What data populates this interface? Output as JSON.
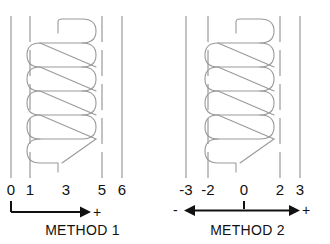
{
  "figure": {
    "title": "",
    "background_color": "#ffffff",
    "line_color": "#9a9a9a",
    "text_color": "#111111",
    "width": 330,
    "height": 244
  },
  "panels": [
    {
      "id": "method-1",
      "caption": "METHOD 1",
      "slot_lines": [
        {
          "name": "slot-line-left-solid",
          "x": 11,
          "style": "solid"
        },
        {
          "name": "slot-line-dashed-1",
          "x": 30,
          "style": "dashed"
        },
        {
          "name": "slot-line-dashed-2",
          "x": 102,
          "style": "dashed"
        },
        {
          "name": "slot-line-right-solid",
          "x": 122,
          "style": "solid"
        }
      ],
      "scale_labels": [
        {
          "text": "0",
          "x": 11
        },
        {
          "text": "1",
          "x": 30
        },
        {
          "text": "3",
          "x": 66
        },
        {
          "text": "5",
          "x": 102
        },
        {
          "text": "6",
          "x": 122
        }
      ],
      "axis": {
        "type": "single-headed",
        "direction": "right",
        "start_x": 11,
        "end_x": 84,
        "has_start_tick": true,
        "has_center_tick": false,
        "plus_label": "+",
        "plus_x": 92,
        "minus_label": "",
        "minus_x": null
      }
    },
    {
      "id": "method-2",
      "caption": "METHOD 2",
      "slot_lines": [
        {
          "name": "slot-line-left-solid",
          "x": 21,
          "style": "solid"
        },
        {
          "name": "slot-line-dashed-1",
          "x": 43,
          "style": "dashed"
        },
        {
          "name": "slot-line-dashed-2",
          "x": 115,
          "style": "dashed"
        },
        {
          "name": "slot-line-right-solid",
          "x": 135,
          "style": "solid"
        }
      ],
      "scale_labels": [
        {
          "text": "-3",
          "x": 21
        },
        {
          "text": "-2",
          "x": 43
        },
        {
          "text": "0",
          "x": 79
        },
        {
          "text": "2",
          "x": 115
        },
        {
          "text": "3",
          "x": 135
        }
      ],
      "axis": {
        "type": "double-headed",
        "direction": "both",
        "start_x": 21,
        "end_x": 133,
        "has_start_tick": false,
        "has_center_tick": true,
        "center_tick_x": 79,
        "plus_label": "+",
        "plus_x": 139,
        "minus_label": "-",
        "minus_x": 9
      }
    }
  ],
  "winding": {
    "description": "zigzag lap winding coil diagram",
    "loop_count": 4,
    "top_lead": true,
    "bottom_lead": true
  }
}
